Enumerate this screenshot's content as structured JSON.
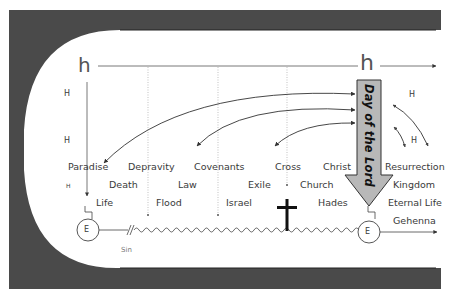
{
  "diagram": {
    "frame_color": "#4a4a4a",
    "accent_gray": "#b8b8b8",
    "line_color": "#444444",
    "top_marker": "h",
    "right_marker": "h",
    "left_axis_labels": [
      "H",
      "H",
      "H"
    ],
    "right_labels": [
      "H",
      "H"
    ],
    "day_of_the_lord": "Day of the Lord",
    "left_event_node": "E",
    "right_event_node": "E",
    "sin_label": "Sin",
    "row1": [
      "Paradise",
      "Depravity",
      "Covenants",
      "Cross",
      "Christ",
      "Resurrection"
    ],
    "row2": [
      "Death",
      "Law",
      "Exile",
      "Church",
      "Kingdom"
    ],
    "row3": [
      "Life",
      "Flood",
      "Israel",
      "Hades",
      "Eternal Life"
    ],
    "row4": [
      "Gehenna"
    ]
  }
}
